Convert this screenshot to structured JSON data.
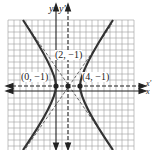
{
  "diagram": {
    "type": "hyperbola",
    "axes": {
      "x": "x",
      "y": "y",
      "x_prime": "x'",
      "y_prime": "y'"
    },
    "points": [
      {
        "label": "(0, −1)",
        "x": 0,
        "y": -1
      },
      {
        "label": "(2, −1)",
        "x": 2,
        "y": -1
      },
      {
        "label": "(4, −1)",
        "x": 4,
        "y": -1
      }
    ],
    "center": {
      "x": 2,
      "y": -1
    },
    "colors": {
      "curve": "#333333",
      "grid": "#999999",
      "axis": "#222222"
    }
  }
}
